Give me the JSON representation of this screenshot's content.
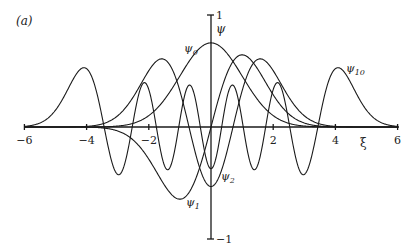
{
  "chart_data": {
    "type": "line",
    "panel_label": "(a)",
    "title": "",
    "xlabel": "ξ",
    "ylabel": "ψ",
    "xlim": [
      -6,
      6
    ],
    "ylim": [
      -1,
      1
    ],
    "x_ticks": [
      -6,
      -4,
      -2,
      2,
      4,
      6
    ],
    "x_tick_labels": [
      "−6",
      "−4",
      "−2",
      "2",
      "4",
      "6"
    ],
    "y_ticks": [
      1,
      -1
    ],
    "y_tick_labels": [
      "1",
      "−1"
    ],
    "grid": false,
    "legend": "inline labels",
    "series": [
      {
        "name": "ψ0",
        "label_main": "ψ",
        "label_sub": "0",
        "n": 0,
        "peak": {
          "x": 0,
          "y": 0.75
        }
      },
      {
        "name": "ψ1",
        "label_main": "ψ",
        "label_sub": "1",
        "n": 1,
        "extrema": [
          {
            "x": -1.0,
            "y": -0.64
          },
          {
            "x": 1.0,
            "y": 0.64
          }
        ]
      },
      {
        "name": "ψ2",
        "label_main": "ψ",
        "label_sub": "2",
        "n": 2,
        "extrema": [
          {
            "x": -1.6,
            "y": 0.59
          },
          {
            "x": 0,
            "y": -0.53
          },
          {
            "x": 1.6,
            "y": 0.59
          }
        ]
      },
      {
        "name": "ψ10",
        "label_main": "ψ",
        "label_sub": "10",
        "n": 10,
        "extrema": [
          {
            "x": -4.0,
            "y": 0.52
          },
          {
            "x": -2.3,
            "y": 0.4
          },
          {
            "x": -0.7,
            "y": 0.41
          },
          {
            "x": 0,
            "y": -0.39
          },
          {
            "x": 0.7,
            "y": 0.41
          },
          {
            "x": 2.3,
            "y": 0.4
          },
          {
            "x": 4.0,
            "y": 0.52
          }
        ]
      }
    ]
  }
}
